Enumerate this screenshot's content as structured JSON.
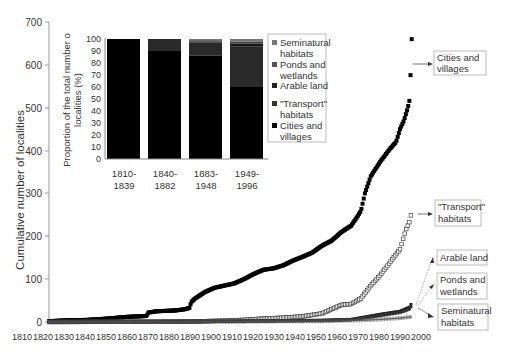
{
  "chart_data": [
    {
      "type": "scatter",
      "title": "",
      "xlabel": "",
      "ylabel": "Cumulative number of localities",
      "xlim": [
        1810,
        2000
      ],
      "ylim": [
        0,
        700
      ],
      "x_ticks": [
        "1810",
        "1820",
        "1830",
        "1840",
        "1850",
        "1860",
        "1870",
        "1880",
        "1890",
        "1900",
        "1910",
        "1920",
        "1930",
        "1940",
        "1950",
        "1960",
        "1970",
        "1980",
        "1990",
        "2000"
      ],
      "y_ticks": [
        "0",
        "100",
        "200",
        "300",
        "400",
        "500",
        "600",
        "700"
      ],
      "grid": false,
      "series": [
        {
          "name": "Cities and villages",
          "marker": "filled-square",
          "x": [
            1810,
            1820,
            1830,
            1840,
            1850,
            1860,
            1861,
            1865,
            1870,
            1875,
            1880,
            1882,
            1883,
            1885,
            1890,
            1895,
            1900,
            1905,
            1910,
            1915,
            1920,
            1925,
            1930,
            1935,
            1940,
            1945,
            1950,
            1955,
            1960,
            1965,
            1968,
            1970,
            1972,
            1975,
            1980,
            1985,
            1988,
            1990,
            1992,
            1994,
            1995,
            1996
          ],
          "y": [
            2,
            4,
            5,
            8,
            12,
            14,
            22,
            25,
            26,
            27,
            30,
            33,
            47,
            55,
            70,
            80,
            85,
            90,
            100,
            112,
            122,
            125,
            132,
            143,
            152,
            162,
            178,
            190,
            210,
            225,
            245,
            260,
            300,
            340,
            375,
            405,
            420,
            450,
            470,
            500,
            520,
            660
          ]
        },
        {
          "name": "\"Transport\" habitats",
          "marker": "open-square",
          "x": [
            1810,
            1880,
            1900,
            1910,
            1920,
            1930,
            1940,
            1950,
            1955,
            1960,
            1965,
            1970,
            1975,
            1980,
            1985,
            1990,
            1993,
            1995,
            1996
          ],
          "y": [
            0,
            1,
            3,
            5,
            8,
            10,
            13,
            20,
            30,
            40,
            42,
            55,
            85,
            110,
            140,
            170,
            215,
            235,
            258
          ]
        },
        {
          "name": "Arable land",
          "marker": "filled-square-small",
          "x": [
            1810,
            1900,
            1950,
            1965,
            1970,
            1980,
            1990,
            1995,
            1996
          ],
          "y": [
            0,
            2,
            4,
            6,
            10,
            18,
            25,
            35,
            45
          ]
        },
        {
          "name": "Ponds and wetlands",
          "marker": "filled-diamond",
          "x": [
            1810,
            1900,
            1950,
            1965,
            1970,
            1980,
            1990,
            1995,
            1996
          ],
          "y": [
            0,
            1,
            3,
            5,
            8,
            15,
            22,
            30,
            38
          ]
        },
        {
          "name": "Seminatural habitats",
          "marker": "plus",
          "x": [
            1810,
            1900,
            1950,
            1970,
            1980,
            1990,
            1996
          ],
          "y": [
            0,
            1,
            2,
            4,
            6,
            9,
            12
          ]
        }
      ],
      "annotations": [
        "Cities and villages",
        "\"Transport\" habitats",
        "Arable land",
        "Ponds and wetlands",
        "Seminatural habitats"
      ]
    },
    {
      "type": "bar",
      "stacked": true,
      "title": "",
      "ylabel": "Proportion of the total number o localities (%)",
      "ylim": [
        0,
        100
      ],
      "y_ticks": [
        "0",
        "10",
        "20",
        "30",
        "40",
        "50",
        "60",
        "70",
        "80",
        "90",
        "100"
      ],
      "categories": [
        "1810-1839",
        "1840-1882",
        "1883-1948",
        "1949-1996"
      ],
      "legend_position": "right",
      "series": [
        {
          "name": "Cities and villages",
          "values": [
            100,
            90,
            86,
            60
          ]
        },
        {
          "name": "\"Transport\" habitats",
          "values": [
            0,
            10,
            11,
            34
          ]
        },
        {
          "name": "Arable land",
          "values": [
            0,
            0,
            1,
            2
          ]
        },
        {
          "name": "Ponds and wetlands",
          "values": [
            0,
            0,
            1,
            2
          ]
        },
        {
          "name": "Seminatural habitats",
          "values": [
            0,
            0,
            1,
            2
          ]
        }
      ]
    }
  ],
  "main": {
    "ylabel": "Cumulative number of localities",
    "yticks": [
      "0",
      "100",
      "200",
      "300",
      "400",
      "500",
      "600",
      "700"
    ],
    "xticks": [
      "1810",
      "1820",
      "1830",
      "1840",
      "1850",
      "1860",
      "1870",
      "1880",
      "1890",
      "1900",
      "1910",
      "1920",
      "1930",
      "1940",
      "1950",
      "1960",
      "1970",
      "1980",
      "1990",
      "2000"
    ],
    "callouts": {
      "cities": [
        "Cities and",
        "villages"
      ],
      "transport": [
        "\"Transport\"",
        "habitats"
      ],
      "arable": [
        "Arable land"
      ],
      "ponds": [
        "Ponds and",
        "wetlands"
      ],
      "seminatural": [
        "Seminatural",
        "habitats"
      ]
    }
  },
  "inset": {
    "ylabel1": "Proportion of the total number o",
    "ylabel2": "localities (%)",
    "yticks": [
      "0",
      "10",
      "20",
      "30",
      "40",
      "50",
      "60",
      "70",
      "80",
      "90",
      "100"
    ],
    "cats": [
      [
        "1810-",
        "1839"
      ],
      [
        "1840-",
        "1882"
      ],
      [
        "1883-",
        "1948"
      ],
      [
        "1949-",
        "1996"
      ]
    ],
    "legend": [
      [
        "Seminatural",
        "habitats"
      ],
      [
        "Ponds and",
        "wetlands"
      ],
      [
        "Arable land",
        ""
      ],
      [
        "\"Transport\"",
        "habitats"
      ],
      [
        "Cities and",
        "villages"
      ]
    ]
  }
}
